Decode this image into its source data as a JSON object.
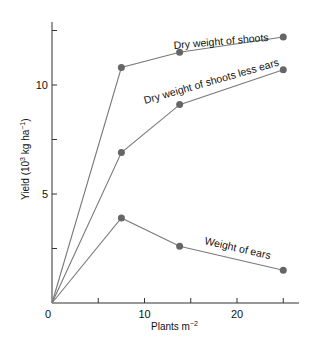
{
  "chart_data": {
    "type": "line",
    "title": "",
    "xlabel": "Plants m",
    "xlabel_sup": "−2",
    "ylabel": "Yield (10",
    "ylabel_sup1": "3",
    "ylabel_mid": " kg ha",
    "ylabel_sup2": "−1",
    "ylabel_end": ")",
    "xlim": [
      0,
      27
    ],
    "ylim": [
      0,
      12.8
    ],
    "x_ticks": [
      0,
      5,
      10,
      15,
      20,
      25
    ],
    "x_tick_labels": [
      "0",
      "",
      "10",
      "",
      "20",
      ""
    ],
    "y_ticks": [
      0,
      2.5,
      5,
      7.5,
      10,
      12.5
    ],
    "y_tick_labels": [
      "",
      "",
      "5",
      "",
      "10",
      ""
    ],
    "grid": false,
    "legend": "inline annotations",
    "series": [
      {
        "name": "Dry weight of shoots",
        "x": [
          0,
          7.5,
          13.8,
          25
        ],
        "y": [
          0,
          10.8,
          11.5,
          12.2
        ],
        "markers": [
          false,
          true,
          true,
          true
        ]
      },
      {
        "name": "Dry weight of shoots less ears",
        "x": [
          0,
          7.5,
          13.8,
          25
        ],
        "y": [
          0,
          6.9,
          9.1,
          10.7
        ],
        "markers": [
          false,
          true,
          true,
          true
        ]
      },
      {
        "name": "Weight of ears",
        "x": [
          0,
          7.5,
          13.8,
          25
        ],
        "y": [
          0,
          3.9,
          2.6,
          1.5
        ],
        "markers": [
          false,
          true,
          true,
          true
        ]
      }
    ],
    "annotations": [
      {
        "text": "Dry weight of shoots",
        "series": 0
      },
      {
        "text": "Dry weight of shoots less ears",
        "series": 1
      },
      {
        "text": "Weight of ears",
        "series": 2
      }
    ],
    "colors": {
      "axis": "#333333",
      "line": "#7a7a7a",
      "marker": "#666666"
    }
  }
}
